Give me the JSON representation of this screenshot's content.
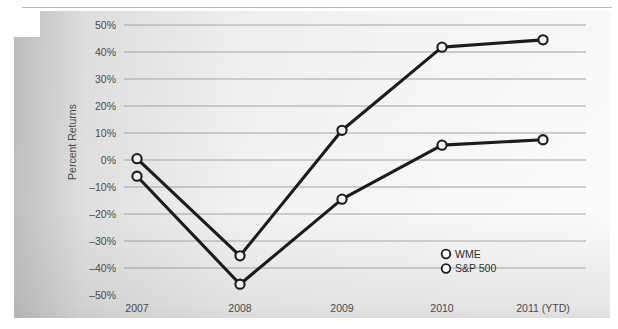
{
  "chart_data": {
    "type": "line",
    "title": "",
    "xlabel": "",
    "ylabel": "Percent Returns",
    "categories": [
      "2007",
      "2008",
      "2009",
      "2010",
      "2011 (YTD)"
    ],
    "ylim": [
      -50,
      50
    ],
    "ytick_values": [
      50,
      40,
      30,
      20,
      10,
      0,
      -10,
      -20,
      -30,
      -40,
      -50
    ],
    "ytick_labels": [
      "50%",
      "40%",
      "30%",
      "20%",
      "10%",
      "0%",
      "–10%",
      "–20%",
      "–30%",
      "–40%",
      "–50%"
    ],
    "grid": true,
    "legend_position": "inside-bottom-right",
    "series": [
      {
        "name": "WME",
        "values": [
          0.5,
          -35.5,
          11.0,
          41.8,
          44.5
        ],
        "color": "#1c1c1c",
        "marker": "circle-open"
      },
      {
        "name": "S&P 500",
        "values": [
          -6.0,
          -46.0,
          -14.5,
          5.5,
          7.5
        ],
        "color": "#1c1c1c",
        "marker": "circle-open"
      }
    ]
  },
  "legend": {
    "items": [
      {
        "label": "WME"
      },
      {
        "label": "S&P 500"
      }
    ]
  },
  "colors": {
    "line": "#1c1c1c",
    "gridline": "#9a9a9a",
    "tick_text": "#4a4a4a",
    "panel_light": "#fdfdfd",
    "panel_dark": "#e0e0e0"
  }
}
